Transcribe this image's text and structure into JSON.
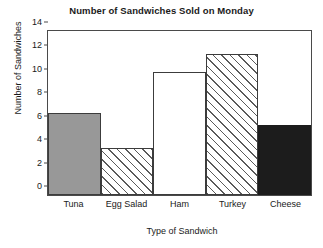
{
  "chart_data": {
    "type": "bar",
    "title": "Number of Sandwiches Sold on Monday",
    "xlabel": "Type of Sandwich",
    "ylabel": "Number of Sandwiches",
    "categories": [
      "Tuna",
      "Egg Salad",
      "Ham",
      "Turkey",
      "Cheese"
    ],
    "values": [
      7,
      4,
      10.5,
      12,
      6
    ],
    "ylim": [
      0,
      14
    ],
    "ytick_labels": [
      "0",
      "2",
      "4",
      "6",
      "8",
      "10",
      "12",
      "14"
    ],
    "ytick_values": [
      0,
      2,
      4,
      6,
      8,
      10,
      12,
      14
    ],
    "grid": false,
    "legend": "none",
    "bar_styles": [
      "solid-gray",
      "hatch-forward-diagonal",
      "white",
      "hatch-forward-diagonal",
      "solid-black"
    ],
    "colors": {
      "tuna": "#989898",
      "egg_salad": "#ffffff",
      "ham": "#ffffff",
      "turkey": "#ffffff",
      "cheese": "#1c1c1c",
      "outline": "#3c3c3c",
      "hatch": "#5a5a5a",
      "axis": "#4a4a4a",
      "text": "#1a1a1a",
      "background": "#ffffff"
    }
  }
}
